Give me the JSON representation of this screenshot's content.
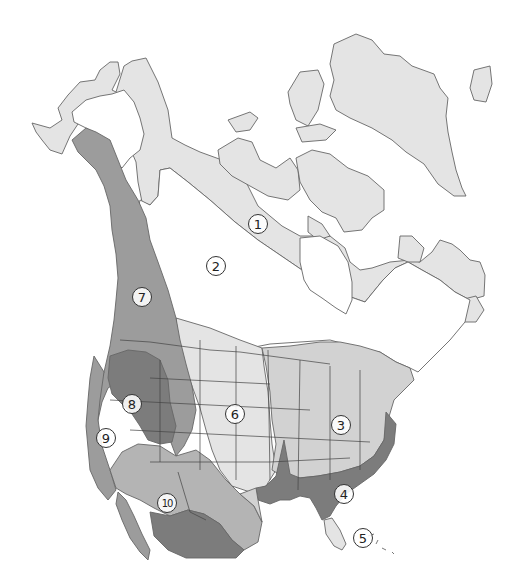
{
  "map": {
    "subject": "North America vegetation / biome zones",
    "colors": {
      "background": "#ffffff",
      "outline": "#555555",
      "tone_lightest": "#e4e4e4",
      "tone_light": "#d2d2d2",
      "tone_medium": "#b4b4b4",
      "tone_medium_dark": "#9c9c9c",
      "tone_dark": "#7c7c7c",
      "none": "#ffffff"
    },
    "zones": [
      {
        "id": "1",
        "label": "1",
        "x": 258,
        "y": 224,
        "tone": "tone_lightest"
      },
      {
        "id": "2",
        "label": "2",
        "x": 216,
        "y": 266,
        "tone": "none"
      },
      {
        "id": "3",
        "label": "3",
        "x": 341,
        "y": 425,
        "tone": "tone_light"
      },
      {
        "id": "4",
        "label": "4",
        "x": 344,
        "y": 494,
        "tone": "tone_dark"
      },
      {
        "id": "5",
        "label": "5",
        "x": 363,
        "y": 538,
        "tone": "tone_lightest"
      },
      {
        "id": "6",
        "label": "6",
        "x": 235,
        "y": 414,
        "tone": "tone_lightest"
      },
      {
        "id": "7",
        "label": "7",
        "x": 142,
        "y": 297,
        "tone": "tone_medium_dark"
      },
      {
        "id": "8",
        "label": "8",
        "x": 132,
        "y": 404,
        "tone": "tone_dark"
      },
      {
        "id": "9",
        "label": "9",
        "x": 106,
        "y": 438,
        "tone": "tone_medium_dark"
      },
      {
        "id": "10",
        "label": "10",
        "x": 167,
        "y": 503,
        "tone": "tone_medium"
      }
    ]
  }
}
